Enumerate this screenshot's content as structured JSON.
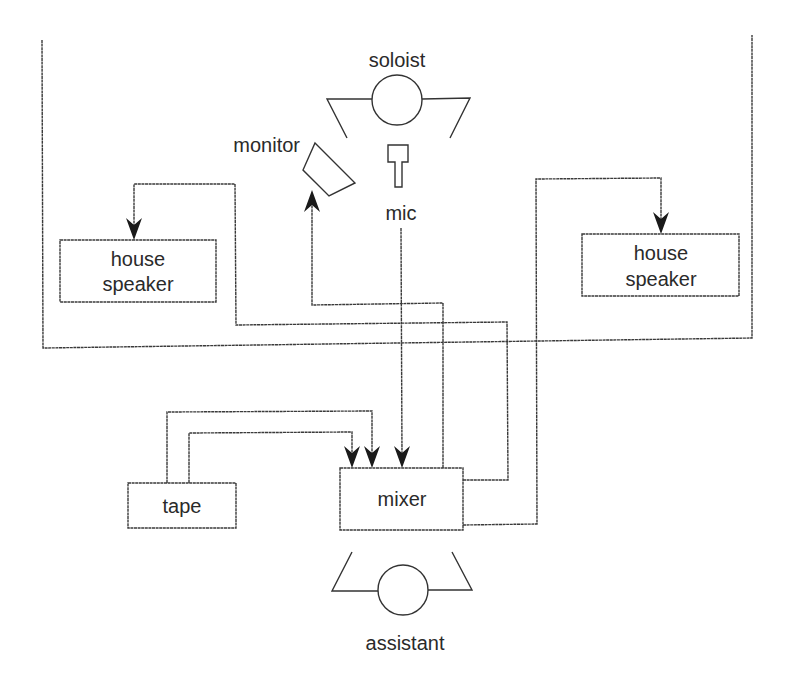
{
  "diagram": {
    "type": "stage-audio-signal-flow",
    "labels": {
      "soloist": "soloist",
      "monitor": "monitor",
      "mic": "mic",
      "house_speaker_left_line1": "house",
      "house_speaker_left_line2": "speaker",
      "house_speaker_right_line1": "house",
      "house_speaker_right_line2": "speaker",
      "tape": "tape",
      "mixer": "mixer",
      "assistant": "assistant"
    },
    "nodes": [
      {
        "id": "soloist",
        "label": "soloist",
        "kind": "person"
      },
      {
        "id": "mic",
        "label": "mic",
        "kind": "microphone"
      },
      {
        "id": "monitor",
        "label": "monitor",
        "kind": "monitor-speaker"
      },
      {
        "id": "house_speaker_left",
        "label": "house speaker",
        "kind": "box"
      },
      {
        "id": "house_speaker_right",
        "label": "house speaker",
        "kind": "box"
      },
      {
        "id": "tape",
        "label": "tape",
        "kind": "box"
      },
      {
        "id": "mixer",
        "label": "mixer",
        "kind": "box"
      },
      {
        "id": "assistant",
        "label": "assistant",
        "kind": "person"
      }
    ],
    "edges": [
      {
        "from": "mic",
        "to": "mixer",
        "arrow": "end"
      },
      {
        "from": "mixer",
        "to": "monitor",
        "arrow": "end"
      },
      {
        "from": "mixer",
        "to": "house_speaker_left",
        "arrow": "end"
      },
      {
        "from": "mixer",
        "to": "house_speaker_right",
        "arrow": "end"
      },
      {
        "from": "tape",
        "to": "mixer",
        "arrow": "end",
        "channel": 1
      },
      {
        "from": "tape",
        "to": "mixer",
        "arrow": "end",
        "channel": 2
      }
    ],
    "regions": [
      {
        "id": "stage",
        "description": "stage boundary enclosing soloist, monitor, mic and house speakers"
      }
    ],
    "colors": {
      "line": "#3a3a3a",
      "arrowhead": "#1a1a1a",
      "text": "#2a2a2a",
      "background": "#ffffff"
    }
  }
}
